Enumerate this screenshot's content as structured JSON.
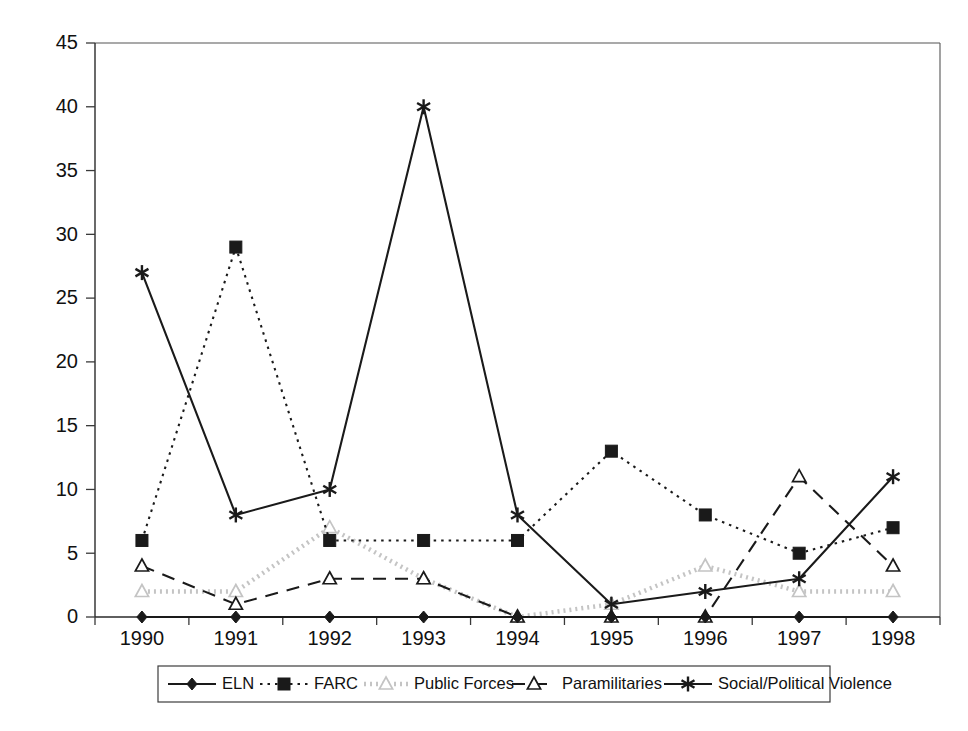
{
  "chart_data": {
    "type": "line",
    "title": "",
    "subtitle": "",
    "xlabel": "",
    "ylabel": "",
    "categories": [
      "1990",
      "1991",
      "1992",
      "1993",
      "1994",
      "1995",
      "1996",
      "1997",
      "1998"
    ],
    "x": [
      1990,
      1991,
      1992,
      1993,
      1994,
      1995,
      1996,
      1997,
      1998
    ],
    "ylim": [
      0,
      45
    ],
    "yticks": [
      0,
      5,
      10,
      15,
      20,
      25,
      30,
      35,
      40,
      45
    ],
    "ytick_labels": [
      "0",
      "5",
      "10",
      "15",
      "20",
      "25",
      "30",
      "35",
      "40",
      "45"
    ],
    "grid": false,
    "legend_position": "bottom",
    "series": [
      {
        "name": "ELN",
        "marker": "diamond-filled",
        "line_style": "solid",
        "color": "#1a1a1a",
        "values": [
          0,
          0,
          0,
          0,
          0,
          0,
          0,
          0,
          0
        ]
      },
      {
        "name": "FARC",
        "marker": "square-filled",
        "line_style": "dotted",
        "color": "#1a1a1a",
        "values": [
          6,
          29,
          6,
          6,
          6,
          13,
          8,
          5,
          7
        ]
      },
      {
        "name": "Public Forces",
        "marker": "triangle-open",
        "line_style": "light-dotted",
        "color": "#c4c4c4",
        "values": [
          2,
          2,
          7,
          3,
          0,
          1,
          4,
          2,
          2
        ]
      },
      {
        "name": "Paramilitaries",
        "marker": "triangle-open",
        "line_style": "dashed",
        "color": "#1a1a1a",
        "values": [
          4,
          1,
          3,
          3,
          0,
          0,
          0,
          11,
          4
        ]
      },
      {
        "name": "Social/Political Violence",
        "marker": "star",
        "line_style": "solid",
        "color": "#1a1a1a",
        "values": [
          27,
          8,
          10,
          40,
          8,
          1,
          2,
          3,
          11
        ]
      }
    ]
  },
  "legend": {
    "items": [
      {
        "label": "ELN"
      },
      {
        "label": "FARC"
      },
      {
        "label": "Public Forces"
      },
      {
        "label": "Paramilitaries"
      },
      {
        "label": "Social/Political Violence"
      }
    ]
  },
  "axes": {
    "y_ticks": [
      "0",
      "5",
      "10",
      "15",
      "20",
      "25",
      "30",
      "35",
      "40",
      "45"
    ],
    "x_ticks": [
      "1990",
      "1991",
      "1992",
      "1993",
      "1994",
      "1995",
      "1996",
      "1997",
      "1998"
    ]
  }
}
